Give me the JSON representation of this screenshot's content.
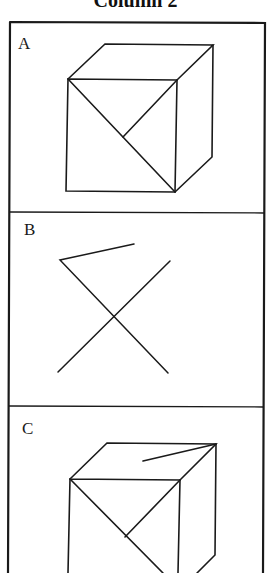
{
  "header": {
    "title": "Column 2"
  },
  "panels": [
    {
      "label": "A",
      "description": "cube with front-face diagonal and half-diagonal"
    },
    {
      "label": "B",
      "description": "crossed lines with short slanted segment"
    },
    {
      "label": "C",
      "description": "cube with front-face diagonals and short top-face segment"
    }
  ],
  "colors": {
    "stroke": "#1a1a1a",
    "background": "#ffffff"
  }
}
